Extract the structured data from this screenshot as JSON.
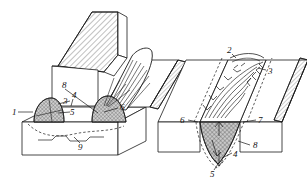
{
  "figure": {
    "type": "technical-line-diagram",
    "background_color": "#ffffff",
    "line_color": "#1a1a1a",
    "hatch_color": "#555555",
    "pool_fill_color": "#b8b8b8",
    "dashed_color": "#333333",
    "views": [
      {
        "name": "left-view",
        "description": "Isometric view of inclined hatched electrode block over plate with weld bead and crystallization contours",
        "callouts": [
          "1",
          "3",
          "4",
          "5",
          "6",
          "8",
          "9"
        ]
      },
      {
        "name": "right-view",
        "description": "Isometric view of weld groove with cross-hatched weld pool and growth-direction ticks",
        "callouts": [
          "2",
          "3",
          "4",
          "5",
          "6",
          "7",
          "8"
        ]
      }
    ]
  },
  "callouts": {
    "left": [
      {
        "id": "c1",
        "text": "1",
        "x": 12,
        "y": 112
      },
      {
        "id": "c3",
        "text": "3",
        "x": 63,
        "y": 100
      },
      {
        "id": "c4",
        "text": "4",
        "x": 72,
        "y": 94
      },
      {
        "id": "c5",
        "text": "5",
        "x": 63,
        "y": 111
      },
      {
        "id": "c6",
        "text": "6",
        "x": 120,
        "y": 110
      },
      {
        "id": "c8",
        "text": "8",
        "x": 62,
        "y": 86
      },
      {
        "id": "c9",
        "text": "9",
        "x": 80,
        "y": 146
      }
    ],
    "right": [
      {
        "id": "r2",
        "text": "2",
        "x": 228,
        "y": 50
      },
      {
        "id": "r3",
        "text": "3",
        "x": 268,
        "y": 71
      },
      {
        "id": "r6",
        "text": "6",
        "x": 182,
        "y": 121
      },
      {
        "id": "r7",
        "text": "7",
        "x": 258,
        "y": 120
      },
      {
        "id": "r8",
        "text": "8",
        "x": 252,
        "y": 146
      },
      {
        "id": "r4",
        "text": "4",
        "x": 233,
        "y": 155
      },
      {
        "id": "r5",
        "text": "5",
        "x": 212,
        "y": 172
      }
    ]
  }
}
